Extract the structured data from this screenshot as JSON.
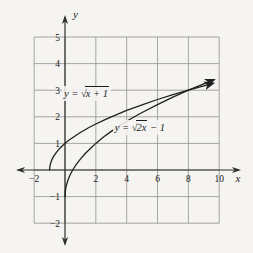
{
  "figure": {
    "background": "#f5f4f1",
    "grid_color": "#909090",
    "axis_color": "#2f2f2f",
    "curve_color": "#202020"
  },
  "chart_data": {
    "type": "line",
    "title": "",
    "xlabel": "x",
    "ylabel": "y",
    "xlim": [
      -2,
      10
    ],
    "ylim": [
      -2,
      5
    ],
    "x_grid_step": 2,
    "y_grid_step": 1,
    "grid": true,
    "legend_position": "none",
    "x_ticks": [
      {
        "v": -2,
        "label": "−2"
      },
      {
        "v": 2,
        "label": "2"
      },
      {
        "v": 4,
        "label": "4"
      },
      {
        "v": 6,
        "label": "6"
      },
      {
        "v": 8,
        "label": "8"
      },
      {
        "v": 10,
        "label": "10"
      }
    ],
    "y_ticks": [
      {
        "v": 5,
        "label": "5"
      },
      {
        "v": 4,
        "label": "4"
      },
      {
        "v": 3,
        "label": "3"
      },
      {
        "v": 2,
        "label": "2"
      },
      {
        "v": 1,
        "label": "1"
      },
      {
        "v": -1,
        "label": "−1"
      },
      {
        "v": -2,
        "label": "−2"
      }
    ],
    "series": [
      {
        "name": "y = √(x + 1)",
        "label": {
          "prefix": "y = ",
          "radical": "√",
          "radicand": "x + 1",
          "suffix": ""
        },
        "label_pos": [
          -0.2,
          3.16
        ],
        "arrow_end": true,
        "points": [
          [
            -1,
            0
          ],
          [
            -0.98,
            0.14
          ],
          [
            -0.92,
            0.28
          ],
          [
            -0.84,
            0.4
          ],
          [
            -0.72,
            0.53
          ],
          [
            -0.56,
            0.66
          ],
          [
            -0.36,
            0.8
          ],
          [
            -0.1,
            0.95
          ],
          [
            0.2,
            1.1
          ],
          [
            0.6,
            1.26
          ],
          [
            1,
            1.41
          ],
          [
            1.5,
            1.58
          ],
          [
            2,
            1.73
          ],
          [
            2.5,
            1.87
          ],
          [
            3,
            2
          ],
          [
            4,
            2.24
          ],
          [
            5,
            2.45
          ],
          [
            6,
            2.65
          ],
          [
            7,
            2.83
          ],
          [
            8,
            3
          ],
          [
            9,
            3.16
          ],
          [
            9.6,
            3.26
          ]
        ]
      },
      {
        "name": "y = √(2x) − 1",
        "label": {
          "prefix": "y = ",
          "radical": "√",
          "radicand": "2x",
          "suffix": " − 1"
        },
        "label_pos": [
          3.1,
          1.88
        ],
        "arrow_end": true,
        "points": [
          [
            0,
            -1
          ],
          [
            0.01,
            -0.86
          ],
          [
            0.045,
            -0.7
          ],
          [
            0.11,
            -0.53
          ],
          [
            0.2,
            -0.37
          ],
          [
            0.32,
            -0.2
          ],
          [
            0.5,
            0
          ],
          [
            0.72,
            0.2
          ],
          [
            1,
            0.41
          ],
          [
            1.3,
            0.61
          ],
          [
            1.7,
            0.84
          ],
          [
            2,
            1
          ],
          [
            2.5,
            1.24
          ],
          [
            3,
            1.45
          ],
          [
            3.5,
            1.65
          ],
          [
            4,
            1.83
          ],
          [
            4.5,
            2
          ],
          [
            5,
            2.16
          ],
          [
            6,
            2.46
          ],
          [
            7,
            2.74
          ],
          [
            8,
            3
          ],
          [
            9,
            3.24
          ],
          [
            9.65,
            3.39
          ]
        ]
      }
    ]
  }
}
